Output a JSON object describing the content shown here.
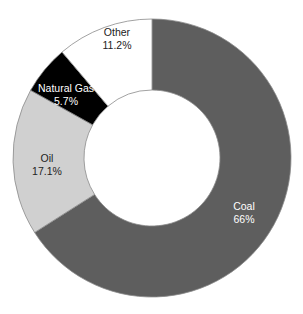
{
  "chart_data": {
    "type": "pie",
    "subtype": "donut",
    "title": "",
    "start_angle_deg": 0,
    "direction": "clockwise",
    "categories": [
      "Coal",
      "Oil",
      "Natural Gas",
      "Other"
    ],
    "values": [
      66,
      17.1,
      5.7,
      11.2
    ],
    "value_labels": [
      "66%",
      "17.1%",
      "5.7%",
      "11.2%"
    ],
    "colors": [
      "#5e5e5e",
      "#d0d0d0",
      "#000000",
      "#ffffff"
    ],
    "label_colors": [
      "#ffffff",
      "#222222",
      "#ffffff",
      "#222222"
    ],
    "legend": "none",
    "geometry": {
      "cx": 152,
      "cy": 158,
      "outer_r": 139,
      "inner_r": 68
    },
    "label_positions": [
      {
        "x": 244,
        "y": 211
      },
      {
        "x": 47,
        "y": 163
      },
      {
        "x": 66,
        "y": 93
      },
      {
        "x": 117,
        "y": 37
      }
    ],
    "stroke_color": "#8a8a8a"
  }
}
